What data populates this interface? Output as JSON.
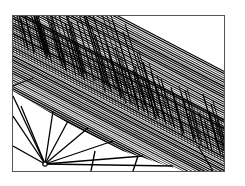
{
  "image": {
    "description": "Black-and-white halftone line-art illustration: dense diagonal hatching band from upper-left to lower-right with fine vertical strokes fading toward upper-right, and radiating lines converging at a small circle in the lower-left",
    "colors": {
      "ink": "#000000",
      "paper": "#ffffff",
      "frame": "#555555"
    }
  }
}
